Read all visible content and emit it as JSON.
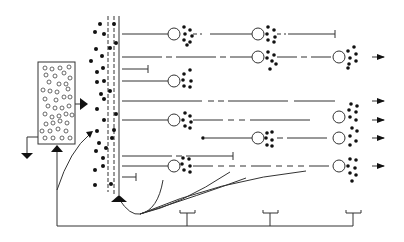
{
  "diagram": {
    "type": "schematic",
    "colors": {
      "stroke": "#333333",
      "fill": "#111111",
      "background": "#ffffff"
    },
    "labels": [],
    "rows": [
      {
        "y": 34,
        "nodes": [
          180,
          265
        ],
        "end": "bar",
        "end_x": 335
      },
      {
        "y": 57,
        "nodes": [
          265,
          345
        ],
        "end": "arrow",
        "end_x": 375
      },
      {
        "y": 69,
        "nodes": [],
        "end": "bar",
        "end_x": 148
      },
      {
        "y": 81,
        "nodes": [
          180
        ],
        "end": "none",
        "end_x": 190
      },
      {
        "y": 101,
        "nodes": [],
        "end": "arrow",
        "end_x": 375
      },
      {
        "y": 120,
        "nodes": [
          180,
          345
        ],
        "end": "arrow",
        "end_x": 375
      },
      {
        "y": 138,
        "nodes": [
          265,
          345
        ],
        "end": "arrow",
        "end_x": 375
      },
      {
        "y": 156,
        "nodes": [],
        "end": "bar",
        "end_x": 233
      },
      {
        "y": 166,
        "nodes": [
          180,
          345
        ],
        "end": "arrow",
        "end_x": 375
      },
      {
        "y": 177,
        "nodes": [],
        "end": "bar",
        "end_x": 136
      }
    ]
  }
}
